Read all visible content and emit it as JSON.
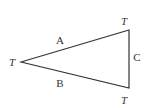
{
  "diagram": {
    "type": "triangle",
    "vertices": [
      {
        "id": "left",
        "label": "T",
        "x": 21,
        "y": 62
      },
      {
        "id": "top-right",
        "label": "T",
        "x": 129,
        "y": 30
      },
      {
        "id": "bottom-right",
        "label": "T",
        "x": 129,
        "y": 88
      }
    ],
    "edges": [
      {
        "id": "A",
        "label": "A",
        "from": "left",
        "to": "top-right"
      },
      {
        "id": "B",
        "label": "B",
        "from": "left",
        "to": "bottom-right"
      },
      {
        "id": "C",
        "label": "C",
        "from": "top-right",
        "to": "bottom-right"
      }
    ],
    "stroke_color": "#333333"
  }
}
